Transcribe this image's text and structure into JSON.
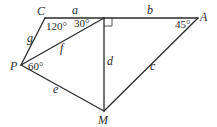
{
  "diagram": {
    "vertices": {
      "C": {
        "label": "C",
        "x": 45,
        "y": 18
      },
      "R": {
        "label": "",
        "x": 104,
        "y": 18
      },
      "A": {
        "label": "A",
        "x": 198,
        "y": 18
      },
      "P": {
        "label": "P",
        "x": 21,
        "y": 65
      },
      "M": {
        "label": "M",
        "x": 104,
        "y": 111
      }
    },
    "edges": [
      {
        "id": "a",
        "label": "a",
        "from": "C",
        "to": "R"
      },
      {
        "id": "b",
        "label": "b",
        "from": "R",
        "to": "A"
      },
      {
        "id": "c",
        "label": "c",
        "from": "A",
        "to": "M"
      },
      {
        "id": "d",
        "label": "d",
        "from": "R",
        "to": "M"
      },
      {
        "id": "e",
        "label": "e",
        "from": "P",
        "to": "M"
      },
      {
        "id": "f",
        "label": "f",
        "from": "P",
        "to": "R"
      },
      {
        "id": "g",
        "label": "g",
        "from": "C",
        "to": "P"
      }
    ],
    "angles": {
      "C": "120°",
      "R_left": "30°",
      "A": "45°",
      "P": "60°",
      "R_right": "right-angle"
    }
  }
}
